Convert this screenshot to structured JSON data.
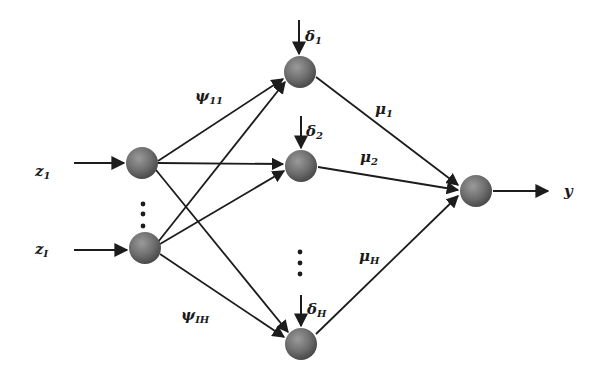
{
  "diagram": {
    "title": "",
    "colors": {
      "edge": "#1c1c1c",
      "node_fill": "#6e6e6e",
      "node_dark": "#4a4a4a",
      "node_light": "#9a9a9a",
      "background": "#ffffff"
    },
    "input_labels": [
      {
        "base": "z",
        "sub": "1"
      },
      {
        "base": "z",
        "sub": "I"
      }
    ],
    "output_label": "y",
    "bias_labels": [
      {
        "base": "δ",
        "sub": "1"
      },
      {
        "base": "δ",
        "sub": "2"
      },
      {
        "base": "δ",
        "sub": "H"
      }
    ],
    "weight_labels_input_hidden": [
      {
        "base": "ψ",
        "sub": "11"
      },
      {
        "base": "ψ",
        "sub": "IH"
      }
    ],
    "weight_labels_hidden_output": [
      {
        "base": "μ",
        "sub": "1"
      },
      {
        "base": "μ",
        "sub": "2"
      },
      {
        "base": "μ",
        "sub": "H"
      }
    ],
    "ellipsis": "⋮",
    "nodes": {
      "inputs": [
        {
          "id": "in1",
          "cx": 142,
          "cy": 163
        },
        {
          "id": "inI",
          "cx": 145,
          "cy": 248
        }
      ],
      "hidden": [
        {
          "id": "h1",
          "cx": 300,
          "cy": 72
        },
        {
          "id": "h2",
          "cx": 301,
          "cy": 166
        },
        {
          "id": "hH",
          "cx": 301,
          "cy": 344
        }
      ],
      "output": {
        "id": "out",
        "cx": 476,
        "cy": 191
      }
    }
  }
}
